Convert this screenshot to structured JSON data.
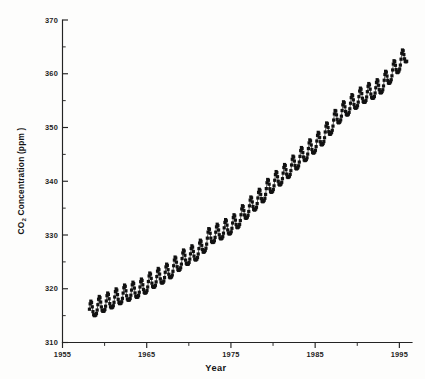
{
  "figure": {
    "background_color": "#fdfdfc",
    "ink_color": "#1a1a1a"
  },
  "axes": {
    "x_title": "Year",
    "y_title_main": "CO",
    "y_title_sub": "2",
    "y_title_rest": " Concentration (ppm )",
    "x_ticks": [
      "1955",
      "1965",
      "1975",
      "1985",
      "1995"
    ],
    "y_ticks": [
      "310",
      "320",
      "330",
      "340",
      "350",
      "360",
      "370"
    ]
  },
  "chart_data": {
    "type": "line",
    "title": "",
    "subtitle": "",
    "xlabel": "Year",
    "ylabel": "CO2 Concentration (ppm )",
    "xlim": [
      1955,
      1996.5
    ],
    "ylim": [
      310,
      370
    ],
    "xticks": [
      1955,
      1965,
      1975,
      1985,
      1995
    ],
    "xticks_minor": [
      1960,
      1970,
      1980,
      1990
    ],
    "yticks": [
      310,
      320,
      330,
      340,
      350,
      360,
      370
    ],
    "yticks_minor": [
      315,
      325,
      335,
      345,
      355,
      365
    ],
    "grid": false,
    "legend": null,
    "marker": "square",
    "marker_size": 1.6,
    "series": [
      {
        "name": "Mauna Loa monthly mean CO2",
        "x_start": 1958.2,
        "x_step": 0.0833333,
        "annual_trend": [
          {
            "year": 1958,
            "value": 315.2
          },
          {
            "year": 1959,
            "value": 315.9
          },
          {
            "year": 1960,
            "value": 316.8
          },
          {
            "year": 1961,
            "value": 317.4
          },
          {
            "year": 1962,
            "value": 318.2
          },
          {
            "year": 1963,
            "value": 318.9
          },
          {
            "year": 1964,
            "value": 319.4
          },
          {
            "year": 1965,
            "value": 320.0
          },
          {
            "year": 1966,
            "value": 321.2
          },
          {
            "year": 1967,
            "value": 322.0
          },
          {
            "year": 1968,
            "value": 322.8
          },
          {
            "year": 1969,
            "value": 324.2
          },
          {
            "year": 1970,
            "value": 325.5
          },
          {
            "year": 1971,
            "value": 326.2
          },
          {
            "year": 1972,
            "value": 327.3
          },
          {
            "year": 1973,
            "value": 329.6
          },
          {
            "year": 1974,
            "value": 330.2
          },
          {
            "year": 1975,
            "value": 331.1
          },
          {
            "year": 1976,
            "value": 332.0
          },
          {
            "year": 1977,
            "value": 333.8
          },
          {
            "year": 1978,
            "value": 335.4
          },
          {
            "year": 1979,
            "value": 336.8
          },
          {
            "year": 1980,
            "value": 338.7
          },
          {
            "year": 1981,
            "value": 340.1
          },
          {
            "year": 1982,
            "value": 341.4
          },
          {
            "year": 1983,
            "value": 343.0
          },
          {
            "year": 1984,
            "value": 344.6
          },
          {
            "year": 1985,
            "value": 346.0
          },
          {
            "year": 1986,
            "value": 347.4
          },
          {
            "year": 1987,
            "value": 349.2
          },
          {
            "year": 1988,
            "value": 351.6
          },
          {
            "year": 1989,
            "value": 353.1
          },
          {
            "year": 1990,
            "value": 354.4
          },
          {
            "year": 1991,
            "value": 355.6
          },
          {
            "year": 1992,
            "value": 356.4
          },
          {
            "year": 1993,
            "value": 357.1
          },
          {
            "year": 1994,
            "value": 358.8
          },
          {
            "year": 1995,
            "value": 360.8
          }
        ],
        "seasonal_amplitude_ppm": 3.1,
        "seasonal_peak_month": 5,
        "notes": "Monthly mean atmospheric CO2, sawtooth seasonal cycle superimposed on rising trend"
      }
    ]
  }
}
